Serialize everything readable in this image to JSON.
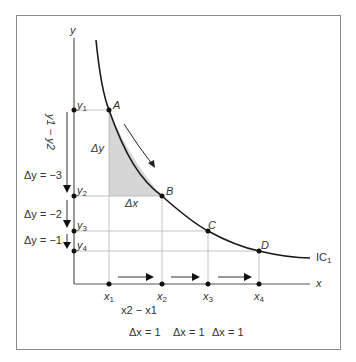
{
  "diagram": {
    "type": "indifference-curve",
    "curve_label": "IC",
    "curve_label_sub": "1",
    "axes": {
      "x_label": "x",
      "y_label": "y"
    },
    "points": [
      {
        "name": "A",
        "x_label": "x",
        "x_sub": "1",
        "y_label": "y",
        "y_sub": "1"
      },
      {
        "name": "B",
        "x_label": "x",
        "x_sub": "2",
        "y_label": "y",
        "y_sub": "2"
      },
      {
        "name": "C",
        "x_label": "x",
        "x_sub": "3",
        "y_label": "y",
        "y_sub": "3"
      },
      {
        "name": "D",
        "x_label": "x",
        "x_sub": "4",
        "y_label": "y",
        "y_sub": "4"
      }
    ],
    "triangle": {
      "dy_label": "Δy",
      "dx_label": "Δx"
    },
    "y_bracket_label": "y1 − y2",
    "delta_y_labels": [
      "Δy = −3",
      "Δy = −2",
      "Δy = −1"
    ],
    "x_diff_label": "x2 − x1",
    "delta_x_labels": [
      "Δx = 1",
      "Δx = 1",
      "Δx = 1"
    ],
    "colors": {
      "curve": "#1a1a1a",
      "shade": "#d6d6d6",
      "grid": "#b5b5b5",
      "axis": "#555555",
      "frame": "#8a8a8a"
    }
  }
}
